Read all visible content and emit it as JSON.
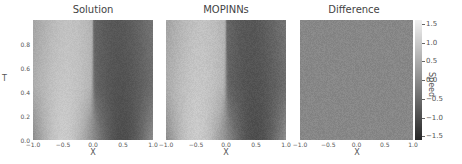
{
  "chart_data": [
    {
      "type": "heatmap",
      "title": "Solution",
      "xlabel": "X",
      "ylabel": "T",
      "xlim": [
        -1.0,
        1.0
      ],
      "ylim": [
        0.0,
        1.0
      ],
      "xticks": [
        "-1.0",
        "-0.5",
        "0.0",
        "0.5",
        "1.0"
      ],
      "yticks": [
        "0.0",
        "0.2",
        "0.4",
        "0.6",
        "0.8"
      ],
      "colormap": "gray",
      "description": "Burgers-type solution: shock at x=0; positive speed left of shock, negative right; initial profile -sin(pi x)"
    },
    {
      "type": "heatmap",
      "title": "MOPINNs",
      "xlabel": "X",
      "xlim": [
        -1.0,
        1.0
      ],
      "ylim": [
        0.0,
        1.0
      ],
      "xticks": [
        "-1.0",
        "-0.5",
        "0.0",
        "0.5",
        "1.0"
      ],
      "colormap": "gray",
      "description": "Model prediction visually matching the reference solution"
    },
    {
      "type": "heatmap",
      "title": "Difference",
      "xlabel": "X",
      "xlim": [
        -1.0,
        1.0
      ],
      "ylim": [
        0.0,
        1.0
      ],
      "xticks": [
        "-1.0",
        "-0.5",
        "0.0",
        "0.5",
        "1.0"
      ],
      "colormap": "gray",
      "description": "Near-zero difference everywhere (uniform mid-gray with noise)"
    }
  ],
  "colorbar": {
    "label": "Speed",
    "range": [
      -1.6,
      1.6
    ],
    "ticks": [
      "1.5",
      "1.0",
      "0.5",
      "0.0",
      "−0.5",
      "−1.0",
      "−1.5"
    ],
    "tick_values": [
      1.5,
      1.0,
      0.5,
      0.0,
      -0.5,
      -1.0,
      -1.5
    ]
  },
  "panels": {
    "solution": {
      "title": "Solution"
    },
    "mopinns": {
      "title": "MOPINNs"
    },
    "difference": {
      "title": "Difference"
    }
  },
  "axes": {
    "xlabel": "X",
    "ylabel": "T",
    "xticks": [
      "−1.0",
      "−0.5",
      "0.0",
      "0.5",
      "1.0"
    ],
    "yticks": [
      "0.0",
      "0.2",
      "0.4",
      "0.6",
      "0.8"
    ]
  }
}
